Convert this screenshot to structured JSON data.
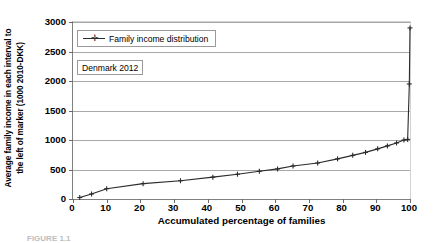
{
  "chart_data": {
    "type": "line",
    "title": "",
    "xlabel": "Accumulated percentage of families",
    "ylabel": "Average family income in each interval to the left of marker (1000 2010-DKK)",
    "ylabel_line1": "Average family income in each interval to",
    "ylabel_line2": "the left of marker (1000 2010-DKK)",
    "xlim": [
      0,
      100
    ],
    "ylim": [
      0,
      3000
    ],
    "xticks": [
      0,
      10,
      20,
      30,
      40,
      50,
      60,
      70,
      80,
      90,
      100
    ],
    "yticks": [
      0,
      500,
      1000,
      1500,
      2000,
      2500,
      3000
    ],
    "grid": "horizontal",
    "legend_position": "upper-left-inside",
    "legend": [
      "Family income distribution"
    ],
    "annotations": [
      "Denmark 2012"
    ],
    "series": [
      {
        "name": "Family income distribution",
        "marker": "plus",
        "color": "#2b2b2b",
        "x": [
          2.0,
          5.5,
          10.0,
          20.8,
          31.9,
          41.5,
          48.8,
          55.3,
          60.7,
          65.3,
          72.6,
          78.5,
          83.0,
          86.8,
          90.4,
          93.3,
          96.0,
          98.2,
          99.3,
          99.8,
          100.0
        ],
        "y": [
          25,
          85,
          175,
          260,
          310,
          370,
          420,
          470,
          510,
          560,
          610,
          680,
          740,
          790,
          850,
          900,
          950,
          1000,
          1010,
          1950,
          2900
        ]
      }
    ]
  },
  "legend": {
    "marker_glyph": "✛",
    "entry_label": "Family income distribution"
  },
  "annotation": {
    "label": "Denmark 2012"
  },
  "axes": {
    "x_title": "Accumulated percentage of families",
    "y_title_line1": "Average family income in each interval to",
    "y_title_line2": "the left of marker (1000 2010-DKK)",
    "x_tick_labels": [
      "0",
      "10",
      "20",
      "30",
      "40",
      "50",
      "60",
      "70",
      "80",
      "90",
      "100"
    ],
    "y_tick_labels": [
      "0",
      "500",
      "1000",
      "1500",
      "2000",
      "2500",
      "3000"
    ]
  },
  "colors": {
    "series": "#2b2b2b",
    "gridline": "#a8a8a8",
    "axis": "#808080",
    "frame_light": "#d2d2d2",
    "text": "#000000"
  },
  "caption": {
    "text": "FIGURE 1.1"
  }
}
